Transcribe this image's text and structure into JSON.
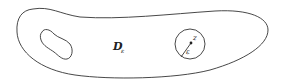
{
  "diagram": {
    "region_label": "D",
    "region_subscript": "ε",
    "point_label": "z",
    "radius_label": "ε",
    "shapes": [
      "outer-boundary",
      "inner-hole",
      "epsilon-disk",
      "radius-line",
      "center-point"
    ],
    "stroke_color": "#333333",
    "background": "#ffffff"
  }
}
